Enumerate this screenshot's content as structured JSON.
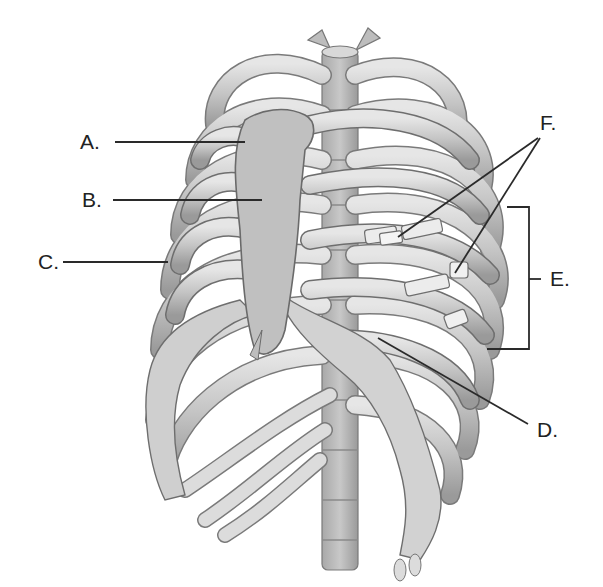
{
  "diagram": {
    "labels": [
      {
        "id": "A",
        "text": "A."
      },
      {
        "id": "B",
        "text": "B."
      },
      {
        "id": "C",
        "text": "C."
      },
      {
        "id": "D",
        "text": "D."
      },
      {
        "id": "E",
        "text": "E."
      },
      {
        "id": "F",
        "text": "F."
      }
    ],
    "colors": {
      "background": "#ffffff",
      "bone_light": "#d9d9d9",
      "bone_mid": "#b5b5b5",
      "bone_shadow": "#8a8a8a",
      "outline": "#6a6a6a",
      "leader_line": "#2a2a2a"
    }
  }
}
